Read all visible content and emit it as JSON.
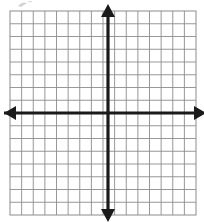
{
  "figure": {
    "title": "",
    "type": "blank-coordinate-grid",
    "background_color": "#ffffff"
  },
  "grid": {
    "left": 10,
    "top": 11,
    "right": 196,
    "bottom": 215,
    "columns": 16,
    "rows": 16,
    "cell_width": 11.625,
    "cell_height": 12.75,
    "line_color": "#8c8c8c",
    "line_width": 0.9,
    "border_color": "#8c8c8c",
    "border_width": 1.0
  },
  "axes": {
    "color": "#1a1a1a",
    "line_width": 3.2,
    "origin_x": 108,
    "origin_y": 113,
    "x_axis": {
      "label": "",
      "y": 113,
      "start_x": 4,
      "end_x": 203,
      "arrow_left": true,
      "arrow_right": true,
      "tick_labels": [],
      "range": [
        -9,
        8
      ]
    },
    "y_axis": {
      "label": "",
      "x": 108,
      "start_y": 8,
      "end_y": 218,
      "arrow_up": true,
      "arrow_down": true,
      "tick_labels": [],
      "range": [
        -8,
        8
      ]
    }
  },
  "arrowheads": {
    "size": 9,
    "color": "#1a1a1a",
    "count": 4,
    "directions": [
      "up",
      "down",
      "left",
      "right"
    ]
  },
  "annotations": {
    "scan_artifact": {
      "present": true,
      "text": "",
      "x": 22,
      "y": 2,
      "color": "#b5b5b5"
    }
  },
  "chart_data": {
    "type": "scatter",
    "title": "",
    "xlabel": "",
    "ylabel": "",
    "categories": [],
    "values": [],
    "series": [],
    "x": [],
    "xlim": [
      -9,
      8
    ],
    "ylim": [
      -8,
      8
    ],
    "grid": true,
    "legend": null,
    "annotations": [],
    "note": "Empty coordinate plane graph paper with bold axes and arrowheads; no plotted data points, no tick labels, no numbers."
  }
}
